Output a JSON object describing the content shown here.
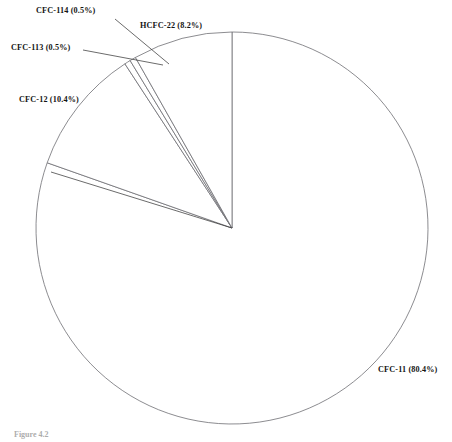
{
  "figure": {
    "caption": "Figure 4.2"
  },
  "chart_data": {
    "type": "pie",
    "title": "",
    "xlabel": "",
    "ylabel": "",
    "legend_position": "none",
    "grid": false,
    "unit": "%",
    "start_angle_deg": 90,
    "direction": "clockwise",
    "center": {
      "x": 232,
      "y": 228
    },
    "radius": 196,
    "categories": [
      "CFC-11",
      "CFC-12",
      "CFC-113",
      "CFC-114",
      "HCFC-22"
    ],
    "values": [
      80.4,
      10.4,
      0.5,
      0.5,
      8.2
    ],
    "slices": [
      {
        "name": "CFC-11",
        "value": 80.4,
        "label": "CFC-11 (80.4%)",
        "start_deg": 0.0,
        "end_deg": 289.44,
        "leader": false
      },
      {
        "name": "CFC-12",
        "value": 10.4,
        "label": "CFC-12 (10.4%)",
        "start_deg": 289.44,
        "end_deg": 326.88,
        "leader": true
      },
      {
        "name": "CFC-113",
        "value": 0.5,
        "label": "CFC-113 (0.5%)",
        "start_deg": 326.88,
        "end_deg": 328.68,
        "leader": true
      },
      {
        "name": "CFC-114",
        "value": 0.5,
        "label": "CFC-114 (0.5%)",
        "start_deg": 328.68,
        "end_deg": 330.48,
        "leader": true
      },
      {
        "name": "HCFC-22",
        "value": 8.2,
        "label": "HCFC-22 (8.2%)",
        "start_deg": 330.48,
        "end_deg": 360.0,
        "leader": false
      }
    ]
  },
  "labels": {
    "cfc11": "CFC-11 (80.4%)",
    "cfc12": "CFC-12 (10.4%)",
    "cfc113": "CFC-113 (0.5%)",
    "cfc114": "CFC-114 (0.5%)",
    "hcfc22": "HCFC-22 (8.2%)"
  },
  "colors": {
    "background": "#ffffff",
    "slice_outline": "#6e6e73",
    "leader_line": "#3a3a3a",
    "label_text": "#141414",
    "caption_text": "#6a6a6a"
  }
}
